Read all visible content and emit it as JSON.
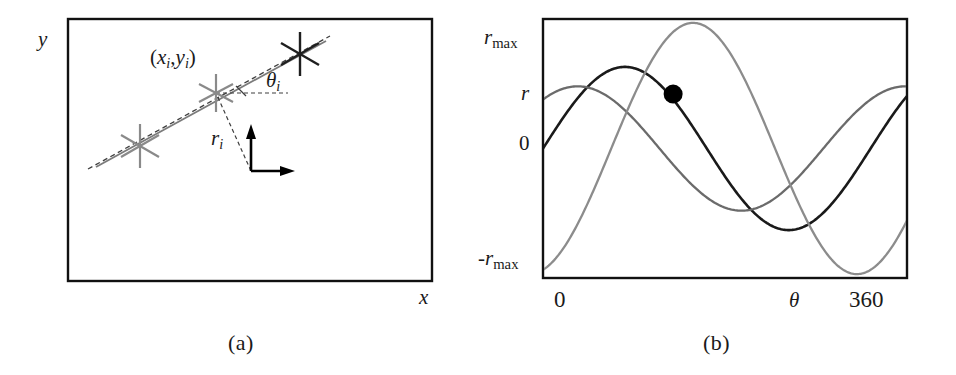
{
  "figure": {
    "panels": [
      {
        "id": "a",
        "caption": "(a)",
        "axis_labels": {
          "x": "x",
          "y": "y"
        },
        "point_label": {
          "prefix": "(",
          "x_sym": "x",
          "x_sub": "i",
          "comma": ",",
          "y_sym": "y",
          "y_sub": "i",
          "suffix": ")"
        },
        "angle_label": {
          "sym": "θ",
          "sub": "i"
        },
        "radius_label": {
          "sym": "r",
          "sub": "i"
        },
        "colors": {
          "frame": "#111111",
          "dark_marker": "#1a1a1a",
          "gray_marker": "#8a8a8a",
          "dashed": "#4a4a4a",
          "solid_line": "#6f6f6f",
          "axis_arrow": "#000000"
        },
        "markers": [
          {
            "name": "feature-point-left",
            "x": 140,
            "y": 146,
            "color": "gray",
            "size": 40
          },
          {
            "name": "feature-point-center",
            "x": 216,
            "y": 93,
            "color": "gray",
            "size": 34
          },
          {
            "name": "feature-point-right",
            "x": 300,
            "y": 54,
            "color": "dark",
            "size": 38
          }
        ],
        "origin_arrows": {
          "x": 251,
          "y": 171,
          "arrow_len": 38
        }
      },
      {
        "id": "b",
        "caption": "(b)",
        "axis_labels": {
          "x": "θ",
          "y_top": "r",
          "y_top_sub": "max",
          "y_mid": "r",
          "y_zero": "0",
          "y_bottom_sign": "-",
          "y_bottom": "r",
          "y_bottom_sub": "max",
          "x_end": "360",
          "x_start": "0"
        },
        "colors": {
          "frame": "#111111",
          "curve_dark": "#1a1a1a",
          "curve_mid": "#6b6b6b",
          "curve_light": "#8c8c8c",
          "intersection_dot": "#000000"
        }
      }
    ]
  },
  "chart_data": {
    "type": "line",
    "title": "",
    "subtitle": "",
    "xlabel": "θ",
    "ylabel": "r",
    "xlim": [
      0,
      400
    ],
    "ylim": [
      -1.0,
      1.0
    ],
    "xticks": [
      0,
      360
    ],
    "xticklabels": [
      "0",
      "360"
    ],
    "yticks": [
      -1.0,
      0.0,
      0.42,
      1.0
    ],
    "yticklabels": [
      "-r_max",
      "0",
      "r",
      "r_max"
    ],
    "grid": false,
    "legend": null,
    "annotations": [
      {
        "name": "intersection-point",
        "x": 143,
        "y": 0.42,
        "label": "",
        "marker": "filled-circle"
      }
    ],
    "series": [
      {
        "name": "sinusoid-dark",
        "color": "#1a1a1a",
        "amplitude": 0.63,
        "phase_deg": 0,
        "offset": 0.0,
        "comment": "r = rmax*sin(theta + phase)",
        "x": [
          0,
          20,
          40,
          60,
          80,
          100,
          120,
          140,
          143,
          160,
          180,
          200,
          220,
          240,
          260,
          280,
          300,
          320,
          340,
          360,
          380,
          400
        ],
        "values": [
          0.0,
          0.19,
          0.36,
          0.5,
          0.59,
          0.63,
          0.62,
          0.45,
          0.42,
          0.22,
          -0.02,
          -0.26,
          -0.45,
          -0.58,
          -0.63,
          -0.6,
          -0.5,
          -0.33,
          -0.12,
          0.11,
          0.33,
          0.52
        ]
      },
      {
        "name": "sinusoid-mid",
        "color": "#6b6b6b",
        "amplitude": 0.48,
        "phase_deg": 52,
        "offset": 0.0,
        "x": [
          0,
          20,
          40,
          60,
          80,
          100,
          120,
          140,
          143,
          160,
          180,
          200,
          220,
          240,
          260,
          280,
          300,
          320,
          340,
          360,
          380,
          400
        ],
        "values": [
          -0.3,
          -0.22,
          -0.13,
          -0.02,
          0.1,
          0.21,
          0.32,
          0.41,
          0.42,
          0.46,
          0.48,
          0.46,
          0.41,
          0.32,
          0.21,
          0.08,
          -0.04,
          -0.13,
          -0.18,
          -0.19,
          -0.16,
          -0.09
        ]
      },
      {
        "name": "sinusoid-light",
        "color": "#8c8c8c",
        "amplitude": 0.97,
        "phase_deg": -75,
        "offset": 0.0,
        "x": [
          0,
          20,
          40,
          60,
          80,
          100,
          120,
          140,
          143,
          160,
          180,
          200,
          220,
          240,
          260,
          280,
          300,
          320,
          340,
          360,
          380,
          400
        ],
        "values": [
          -0.92,
          -0.87,
          -0.74,
          -0.53,
          -0.25,
          0.05,
          0.3,
          0.41,
          0.42,
          0.72,
          0.9,
          0.97,
          0.94,
          0.8,
          0.56,
          0.26,
          -0.07,
          -0.4,
          -0.68,
          -0.87,
          -0.95,
          -0.9
        ]
      }
    ]
  }
}
